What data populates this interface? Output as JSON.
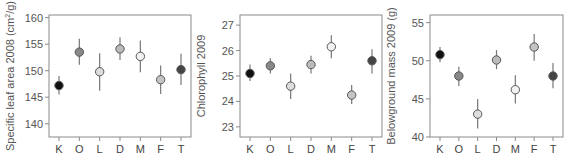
{
  "chart_data": [
    {
      "type": "scatter",
      "title": "",
      "xlabel": "",
      "ylabel": "Specific leaf area 2008 (cm²/g)",
      "ylabel_parts": {
        "main": "Specific leaf area 2008 (cm",
        "sup": "2",
        "tail": "/g)"
      },
      "categories": [
        "K",
        "O",
        "L",
        "D",
        "M",
        "F",
        "T"
      ],
      "ylim": [
        137.5,
        160.5
      ],
      "yticks": [
        140,
        145,
        150,
        155,
        160
      ],
      "series": [
        {
          "name": "mean",
          "values": [
            147.2,
            153.5,
            149.8,
            154.1,
            152.7,
            148.3,
            150.2
          ],
          "err_low": [
            145.5,
            151.1,
            146.2,
            152.0,
            149.7,
            145.6,
            147.3
          ],
          "err_high": [
            149.0,
            156.0,
            153.3,
            156.3,
            155.7,
            151.0,
            153.2
          ]
        }
      ],
      "grid": false
    },
    {
      "type": "scatter",
      "title": "",
      "xlabel": "",
      "ylabel": "Chlorophyll 2009",
      "categories": [
        "K",
        "O",
        "L",
        "D",
        "M",
        "F",
        "T"
      ],
      "ylim": [
        22.6,
        27.4
      ],
      "yticks": [
        23,
        24,
        25,
        26,
        27
      ],
      "series": [
        {
          "name": "mean",
          "values": [
            25.1,
            25.4,
            24.6,
            25.45,
            26.15,
            24.25,
            25.6
          ],
          "err_low": [
            24.8,
            25.1,
            24.1,
            25.1,
            25.7,
            23.9,
            25.1
          ],
          "err_high": [
            25.45,
            25.7,
            25.1,
            25.8,
            26.6,
            24.65,
            26.05
          ]
        }
      ],
      "grid": false
    },
    {
      "type": "scatter",
      "title": "",
      "xlabel": "",
      "ylabel": "Belowground mass 2009 (g)",
      "categories": [
        "K",
        "O",
        "L",
        "D",
        "M",
        "F",
        "T"
      ],
      "ylim": [
        40,
        56
      ],
      "yticks": [
        40,
        45,
        50,
        55
      ],
      "series": [
        {
          "name": "mean",
          "values": [
            50.8,
            48.0,
            43.0,
            50.1,
            46.2,
            51.8,
            48.0
          ],
          "err_low": [
            49.8,
            46.7,
            41.1,
            48.9,
            44.4,
            50.0,
            46.4
          ],
          "err_high": [
            51.8,
            49.2,
            45.0,
            51.4,
            48.1,
            53.5,
            49.7
          ]
        }
      ],
      "grid": false
    }
  ],
  "marker_colors": {
    "K": "#111111",
    "O": "#888888",
    "L": "#dddddd",
    "D": "#bbbbbb",
    "M": "#f2f2f2",
    "F": "#c4c4c4",
    "T": "#444444"
  }
}
